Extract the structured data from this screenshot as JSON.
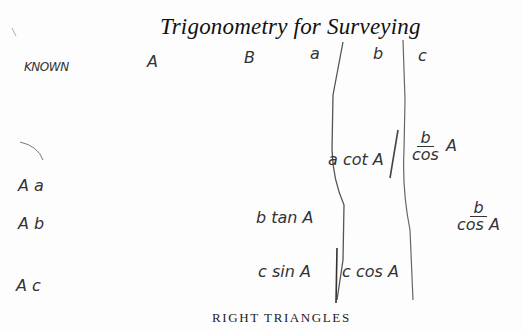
{
  "page": {
    "title": "Trigonometry for Surveying",
    "caption": "RIGHT TRIANGLES"
  },
  "table": {
    "header": {
      "known": "KNOWN",
      "columns": [
        "A",
        "B",
        "a",
        "b",
        "c"
      ]
    },
    "rows": [
      {
        "known": "A a",
        "b": "a cot A",
        "c": {
          "numerator": "b",
          "denominator": "cos",
          "suffix": "A"
        }
      },
      {
        "known": "A b",
        "a": "b tan A",
        "c": {
          "numerator": "b",
          "denominator": "cos A"
        }
      },
      {
        "known": "A c",
        "a": "c sin A",
        "b": "c cos A"
      }
    ]
  }
}
